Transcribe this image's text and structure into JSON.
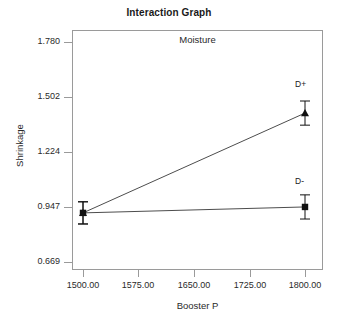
{
  "chart_data": {
    "type": "line",
    "title": "Interaction Graph",
    "subtitle": "Moisture",
    "xlabel": "Booster P",
    "ylabel": "Shrinkage",
    "x": [
      1500.0,
      1800.0
    ],
    "xticklabels": [
      "1500.00",
      "1575.00",
      "1650.00",
      "1725.00",
      "1800.00"
    ],
    "xtickvalues": [
      1500.0,
      1575.0,
      1650.0,
      1725.0,
      1800.0
    ],
    "yticklabels": [
      "1.780",
      "1.502",
      "1.224",
      "0.947",
      "0.669"
    ],
    "ytickvalues": [
      1.78,
      1.502,
      1.224,
      0.947,
      0.669
    ],
    "xlim": [
      1500.0,
      1800.0
    ],
    "ylim": [
      0.669,
      1.78
    ],
    "grid": false,
    "legend": "inline-endpoint-labels",
    "series": [
      {
        "name": "D+",
        "marker": "triangle",
        "values": [
          0.917,
          1.421
        ],
        "errors": [
          0.056,
          0.061
        ]
      },
      {
        "name": "D-",
        "marker": "square",
        "values": [
          0.917,
          0.947
        ],
        "errors": [
          0.056,
          0.061
        ]
      }
    ],
    "annotations": [
      {
        "text": "D+",
        "x": 1800.0,
        "y": 1.421
      },
      {
        "text": "D-",
        "x": 1800.0,
        "y": 0.947
      }
    ],
    "colors": {
      "line": "#4d4d4d",
      "marker": "#111111",
      "axis": "#9a9a9a",
      "text": "#2a2a2a",
      "background": "#ffffff"
    }
  }
}
